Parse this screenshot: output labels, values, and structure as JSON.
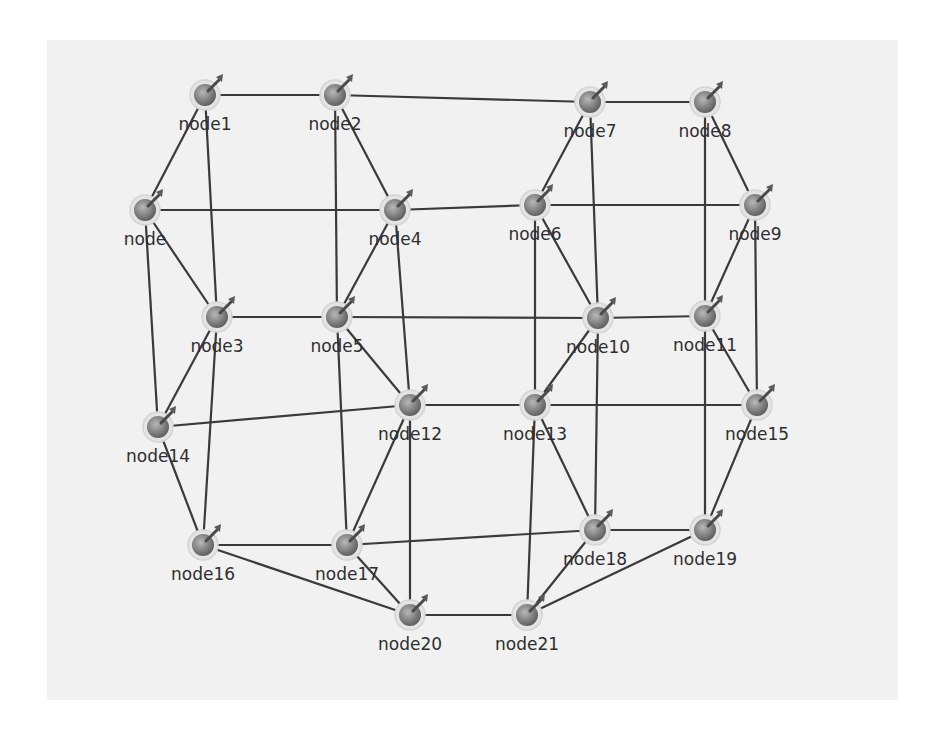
{
  "diagram": {
    "type": "network-graph",
    "background_color": "#f1f1f1",
    "edge_color": "#3a3a3a",
    "node_color": "#8a8a8a",
    "nodes": [
      {
        "id": "node1",
        "label": "node1",
        "x": 205,
        "y": 95
      },
      {
        "id": "node2",
        "label": "node2",
        "x": 335,
        "y": 95
      },
      {
        "id": "node7",
        "label": "node7",
        "x": 590,
        "y": 102
      },
      {
        "id": "node8",
        "label": "node8",
        "x": 705,
        "y": 102
      },
      {
        "id": "node",
        "label": "node",
        "x": 145,
        "y": 210
      },
      {
        "id": "node4",
        "label": "node4",
        "x": 395,
        "y": 210
      },
      {
        "id": "node6",
        "label": "node6",
        "x": 535,
        "y": 205
      },
      {
        "id": "node9",
        "label": "node9",
        "x": 755,
        "y": 205
      },
      {
        "id": "node3",
        "label": "node3",
        "x": 217,
        "y": 317
      },
      {
        "id": "node5",
        "label": "node5",
        "x": 337,
        "y": 317
      },
      {
        "id": "node10",
        "label": "node10",
        "x": 598,
        "y": 318
      },
      {
        "id": "node11",
        "label": "node11",
        "x": 705,
        "y": 316
      },
      {
        "id": "node14",
        "label": "node14",
        "x": 158,
        "y": 427
      },
      {
        "id": "node12",
        "label": "node12",
        "x": 410,
        "y": 405
      },
      {
        "id": "node13",
        "label": "node13",
        "x": 535,
        "y": 405
      },
      {
        "id": "node15",
        "label": "node15",
        "x": 757,
        "y": 405
      },
      {
        "id": "node16",
        "label": "node16",
        "x": 203,
        "y": 545
      },
      {
        "id": "node17",
        "label": "node17",
        "x": 347,
        "y": 545
      },
      {
        "id": "node18",
        "label": "node18",
        "x": 595,
        "y": 530
      },
      {
        "id": "node19",
        "label": "node19",
        "x": 705,
        "y": 530
      },
      {
        "id": "node20",
        "label": "node20",
        "x": 410,
        "y": 615
      },
      {
        "id": "node21",
        "label": "node21",
        "x": 527,
        "y": 615
      }
    ],
    "edges": [
      [
        "node1",
        "node2"
      ],
      [
        "node2",
        "node7"
      ],
      [
        "node7",
        "node8"
      ],
      [
        "node1",
        "node"
      ],
      [
        "node1",
        "node3"
      ],
      [
        "node2",
        "node5"
      ],
      [
        "node2",
        "node4"
      ],
      [
        "node",
        "node4"
      ],
      [
        "node4",
        "node6"
      ],
      [
        "node6",
        "node9"
      ],
      [
        "node",
        "node3"
      ],
      [
        "node",
        "node14"
      ],
      [
        "node7",
        "node6"
      ],
      [
        "node7",
        "node10"
      ],
      [
        "node8",
        "node9"
      ],
      [
        "node8",
        "node11"
      ],
      [
        "node4",
        "node5"
      ],
      [
        "node4",
        "node12"
      ],
      [
        "node3",
        "node5"
      ],
      [
        "node5",
        "node10"
      ],
      [
        "node10",
        "node11"
      ],
      [
        "node6",
        "node10"
      ],
      [
        "node6",
        "node13"
      ],
      [
        "node9",
        "node11"
      ],
      [
        "node9",
        "node15"
      ],
      [
        "node11",
        "node15"
      ],
      [
        "node11",
        "node19"
      ],
      [
        "node3",
        "node14"
      ],
      [
        "node3",
        "node16"
      ],
      [
        "node14",
        "node12"
      ],
      [
        "node12",
        "node13"
      ],
      [
        "node13",
        "node15"
      ],
      [
        "node10",
        "node13"
      ],
      [
        "node10",
        "node18"
      ],
      [
        "node13",
        "node18"
      ],
      [
        "node13",
        "node21"
      ],
      [
        "node5",
        "node17"
      ],
      [
        "node5",
        "node12"
      ],
      [
        "node12",
        "node17"
      ],
      [
        "node12",
        "node20"
      ],
      [
        "node14",
        "node16"
      ],
      [
        "node16",
        "node17"
      ],
      [
        "node16",
        "node20"
      ],
      [
        "node17",
        "node20"
      ],
      [
        "node17",
        "node18"
      ],
      [
        "node18",
        "node19"
      ],
      [
        "node18",
        "node21"
      ],
      [
        "node19",
        "node21"
      ],
      [
        "node15",
        "node19"
      ],
      [
        "node20",
        "node21"
      ]
    ],
    "node_icon": "pinned-sphere-icon"
  }
}
